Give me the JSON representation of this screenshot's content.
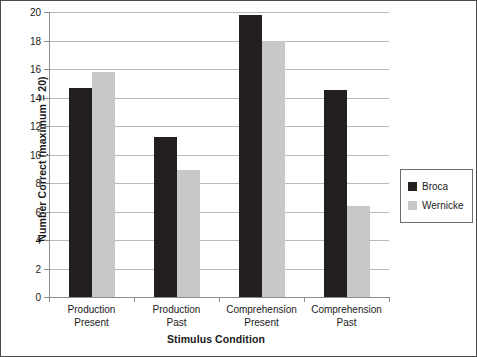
{
  "chart_data": {
    "type": "bar",
    "title": "",
    "subtitle": "",
    "xlabel": "Stimulus Condition",
    "ylabel": "Number Correct (maximum = 20)",
    "categories": [
      "Production Present",
      "Production Past",
      "Comprehension Present",
      "Comprehension Past"
    ],
    "category_lines": [
      [
        "Production",
        "Present"
      ],
      [
        "Production",
        "Past"
      ],
      [
        "Comprehension",
        "Present"
      ],
      [
        "Comprehension",
        "Past"
      ]
    ],
    "series": [
      {
        "name": "Broca",
        "color": "#231f20",
        "values": [
          14.7,
          11.2,
          19.8,
          14.5
        ]
      },
      {
        "name": "Wernicke",
        "color": "#c8c8c8",
        "values": [
          15.8,
          8.9,
          18.0,
          6.4
        ]
      }
    ],
    "ylim": [
      0,
      20
    ],
    "ytick_step": 2,
    "yticks": [
      0,
      2,
      4,
      6,
      8,
      10,
      12,
      14,
      16,
      18,
      20
    ],
    "ytick_labels": [
      "0",
      "2",
      "4",
      "6",
      "8",
      "10",
      "12",
      "14",
      "16",
      "18",
      "20"
    ],
    "grid": true,
    "grid_axis": "y",
    "grid_color": "#b9b9b9",
    "legend_position": "right",
    "legend_entries": [
      "Broca",
      "Wernicke"
    ],
    "background_color": "#ffffff",
    "axis_color": "#8c8c8c",
    "text_color": "#1a1a1a"
  }
}
